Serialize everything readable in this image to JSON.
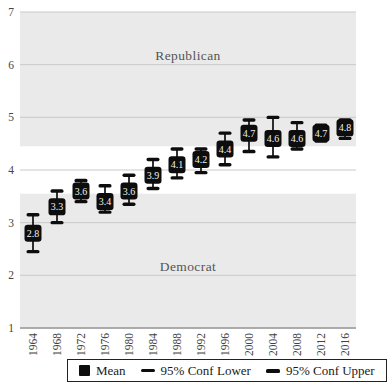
{
  "chart_data": {
    "type": "scatter",
    "subtype": "mean-with-95ci",
    "title": "",
    "categories": [
      "1964",
      "1968",
      "1972",
      "1976",
      "1980",
      "1984",
      "1988",
      "1992",
      "1996",
      "2000",
      "2004",
      "2008",
      "2012",
      "2016"
    ],
    "series": [
      {
        "name": "Mean",
        "values": [
          2.8,
          3.3,
          3.6,
          3.4,
          3.6,
          3.9,
          4.1,
          4.2,
          4.4,
          4.7,
          4.6,
          4.6,
          4.7,
          4.8
        ]
      },
      {
        "name": "95% Conf Lower",
        "values": [
          2.45,
          3.0,
          3.4,
          3.2,
          3.35,
          3.65,
          3.85,
          3.95,
          4.1,
          4.35,
          4.25,
          4.4,
          4.55,
          4.6
        ]
      },
      {
        "name": "95% Conf Upper",
        "values": [
          3.15,
          3.6,
          3.8,
          3.7,
          3.9,
          4.2,
          4.4,
          4.4,
          4.7,
          4.95,
          5.0,
          4.9,
          4.85,
          4.95
        ]
      }
    ],
    "ylim": [
      1,
      7
    ],
    "y_ticks": [
      1,
      2,
      3,
      4,
      5,
      6,
      7
    ],
    "grid": "horizontal",
    "bands": [
      {
        "name": "republican-band",
        "from": 4.45,
        "to": 7
      },
      {
        "name": "democrat-band",
        "from": 1,
        "to": 3.55
      }
    ],
    "region_labels": {
      "top": "Republican",
      "bottom": "Democrat"
    },
    "legend": {
      "position": "bottom-center",
      "items": [
        {
          "label": "Mean",
          "marker": "filled-square"
        },
        {
          "label": "95% Conf Lower",
          "marker": "dash"
        },
        {
          "label": "95% Conf Upper",
          "marker": "dash-thick"
        }
      ]
    },
    "colors": {
      "marker": "#0d0d0d",
      "marker_text": "#f2f2f2",
      "band": "#eaeaea",
      "gridline": "#c9c9c9",
      "axis_line": "#9a9a9a",
      "tick_text": "#454545",
      "region_text": "#555555"
    }
  }
}
